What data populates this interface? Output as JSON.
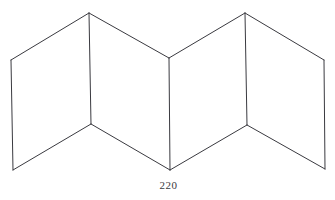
{
  "figure": {
    "caption": "220",
    "caption_position": "bottom-center",
    "background_color": "#ffffff",
    "line_color": "#3a3a40",
    "fill_color": "#ffffff",
    "line_width": 1,
    "canvas": {
      "width": 335,
      "height": 200
    },
    "vertices": {
      "left_outer_top": [
        11,
        60
      ],
      "left_outer_bottom": [
        13,
        170
      ],
      "left_peak": [
        89,
        13
      ],
      "left_valley": [
        91,
        124
      ],
      "center_top": [
        169,
        58
      ],
      "center_bottom": [
        170,
        170
      ],
      "right_peak": [
        245,
        13
      ],
      "right_valley": [
        247,
        125
      ],
      "right_outer_top": [
        324,
        60
      ],
      "right_outer_bottom": [
        325,
        169
      ]
    },
    "panels": [
      {
        "name": "panel-1-left-outer",
        "points": "11,60 89,13 91,124 13,170"
      },
      {
        "name": "panel-2-left-inner",
        "points": "89,13 169,58 170,170 91,124"
      },
      {
        "name": "panel-3-right-inner",
        "points": "169,58 245,13 247,125 170,170"
      },
      {
        "name": "panel-4-right-outer",
        "points": "245,13 324,60 325,169 247,125"
      }
    ],
    "edges": [
      {
        "name": "edge-left-outer-vertical",
        "points": "11,60 13,170"
      },
      {
        "name": "edge-left-fold-vertical",
        "points": "89,13 91,124"
      },
      {
        "name": "edge-center-fold-vertical",
        "points": "169,58 170,170"
      },
      {
        "name": "edge-right-fold-vertical",
        "points": "245,13 247,125"
      },
      {
        "name": "edge-right-outer-vertical",
        "points": "324,60 325,169"
      },
      {
        "name": "edge-top-1",
        "points": "11,60 89,13"
      },
      {
        "name": "edge-top-2",
        "points": "89,13 169,58"
      },
      {
        "name": "edge-top-3",
        "points": "169,58 245,13"
      },
      {
        "name": "edge-top-4",
        "points": "245,13 324,60"
      },
      {
        "name": "edge-bottom-1",
        "points": "13,170 91,124"
      },
      {
        "name": "edge-bottom-2",
        "points": "91,124 170,170"
      },
      {
        "name": "edge-bottom-3",
        "points": "170,170 247,125"
      },
      {
        "name": "edge-bottom-4",
        "points": "247,125 325,169"
      }
    ]
  }
}
